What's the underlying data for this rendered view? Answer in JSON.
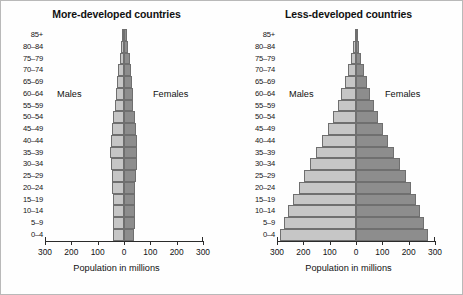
{
  "figure": {
    "background_color": "#ffffff",
    "border_color": "#b9b9b9"
  },
  "colors": {
    "male_fill": "#c6c6c6",
    "female_fill": "#8d8d8d",
    "bar_border": "#6f6f6f",
    "axis": "#2b2b2b",
    "text": "#111111"
  },
  "chart_data": [
    {
      "type": "bar",
      "orientation": "population-pyramid",
      "title": "More-developed countries",
      "xlabel": "Population in millions",
      "ylabel": "",
      "xlim": [
        -300,
        300
      ],
      "xticks": [
        -300,
        -200,
        -100,
        0,
        100,
        200,
        300
      ],
      "xtick_labels": [
        "300",
        "200",
        "100",
        "0",
        "100",
        "200",
        "300"
      ],
      "grid": false,
      "legend_position": "in-plot",
      "categories": [
        "0–4",
        "5–9",
        "10–14",
        "15–19",
        "20–24",
        "25–29",
        "30–34",
        "35–39",
        "40–44",
        "45–49",
        "50–54",
        "55–59",
        "60–64",
        "65–69",
        "70–74",
        "75–79",
        "80–84",
        "85+"
      ],
      "series": [
        {
          "name": "Males",
          "side": "left",
          "values": [
            41,
            42,
            43,
            43,
            44,
            47,
            50,
            52,
            51,
            46,
            41,
            33,
            30,
            27,
            23,
            17,
            10,
            6
          ]
        },
        {
          "name": "Females",
          "side": "right",
          "values": [
            39,
            40,
            41,
            41,
            43,
            46,
            49,
            51,
            50,
            46,
            42,
            35,
            33,
            31,
            28,
            23,
            16,
            12
          ]
        }
      ],
      "annotations": [
        {
          "text": "Males",
          "position": "left-upper"
        },
        {
          "text": "Females",
          "position": "right-upper"
        }
      ]
    },
    {
      "type": "bar",
      "orientation": "population-pyramid",
      "title": "Less-developed countries",
      "xlabel": "Population in millions",
      "ylabel": "",
      "xlim": [
        -300,
        300
      ],
      "xticks": [
        -300,
        -200,
        -100,
        0,
        100,
        200,
        300
      ],
      "xtick_labels": [
        "300",
        "200",
        "100",
        "0",
        "100",
        "200",
        "300"
      ],
      "grid": false,
      "legend_position": "in-plot",
      "categories": [
        "0–4",
        "5–9",
        "10–14",
        "15–19",
        "20–24",
        "25–29",
        "30–34",
        "35–39",
        "40–44",
        "45–49",
        "50–54",
        "55–59",
        "60–64",
        "65–69",
        "70–74",
        "75–79",
        "80–84",
        "85+"
      ],
      "series": [
        {
          "name": "Males",
          "side": "left",
          "values": [
            288,
            272,
            258,
            240,
            218,
            197,
            174,
            152,
            128,
            106,
            88,
            70,
            56,
            42,
            30,
            19,
            10,
            4
          ]
        },
        {
          "name": "Females",
          "side": "right",
          "values": [
            272,
            258,
            244,
            228,
            208,
            188,
            166,
            145,
            122,
            101,
            84,
            67,
            54,
            41,
            30,
            20,
            11,
            5
          ]
        }
      ],
      "annotations": [
        {
          "text": "Males",
          "position": "left-upper"
        },
        {
          "text": "Females",
          "position": "right-upper"
        }
      ]
    }
  ],
  "panels": [
    {
      "id": "more-developed",
      "title": "More-developed countries",
      "males_label": "Males",
      "females_label": "Females",
      "axis_title": "Population in millions"
    },
    {
      "id": "less-developed",
      "title": "Less-developed countries",
      "males_label": "Males",
      "females_label": "Females",
      "axis_title": "Population in millions"
    }
  ]
}
